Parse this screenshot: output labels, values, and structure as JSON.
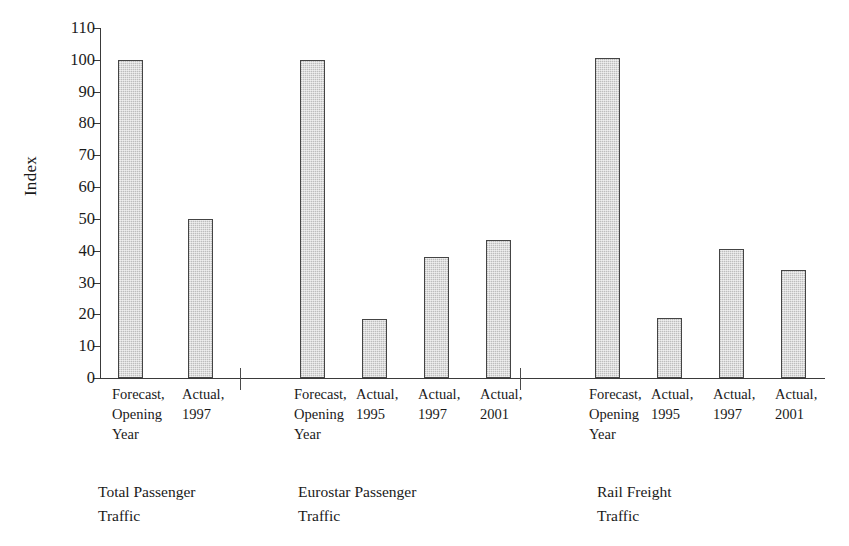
{
  "chart_data": {
    "type": "bar",
    "title": "",
    "xlabel": "",
    "ylabel": "Index",
    "ylim": [
      0,
      110
    ],
    "ytick_step": 10,
    "yticks": [
      0,
      10,
      20,
      30,
      40,
      50,
      60,
      70,
      80,
      90,
      100,
      110
    ],
    "grid": false,
    "legend": "none",
    "bar_fill_color": "#c9c9c9",
    "bar_border_color": "#444444",
    "axis_color": "#3a3a3a",
    "background_color": "#ffffff",
    "groups": [
      {
        "caption_lines": [
          "Total Passenger",
          "Traffic"
        ],
        "categories": [
          {
            "lines": [
              "Forecast,",
              "Opening",
              "Year"
            ],
            "value": 100
          },
          {
            "lines": [
              "Actual,",
              "1997"
            ],
            "value": 50
          }
        ]
      },
      {
        "caption_lines": [
          "Eurostar Passenger",
          "Traffic"
        ],
        "categories": [
          {
            "lines": [
              "Forecast,",
              "Opening",
              "Year"
            ],
            "value": 100
          },
          {
            "lines": [
              "Actual,",
              "1995"
            ],
            "value": 18.5
          },
          {
            "lines": [
              "Actual,",
              "1997"
            ],
            "value": 38
          },
          {
            "lines": [
              "Actual,",
              "2001"
            ],
            "value": 43.5
          }
        ]
      },
      {
        "caption_lines": [
          "Rail Freight",
          "Traffic"
        ],
        "categories": [
          {
            "lines": [
              "Forecast,",
              "Opening",
              "Year"
            ],
            "value": 100.5
          },
          {
            "lines": [
              "Actual,",
              "1995"
            ],
            "value": 19
          },
          {
            "lines": [
              "Actual,",
              "1997"
            ],
            "value": 40.5
          },
          {
            "lines": [
              "Actual,",
              "2001"
            ],
            "value": 34
          }
        ]
      }
    ],
    "categories": [
      "Forecast, Opening Year",
      "Actual, 1997",
      "Forecast, Opening Year",
      "Actual, 1995",
      "Actual, 1997",
      "Actual, 2001",
      "Forecast, Opening Year",
      "Actual, 1995",
      "Actual, 1997",
      "Actual, 2001"
    ],
    "values": [
      100,
      50,
      100,
      18.5,
      38,
      43.5,
      100.5,
      19,
      40.5,
      34
    ]
  },
  "layout": {
    "bar_x": [
      18,
      88,
      200,
      262,
      324,
      386,
      495,
      557,
      619,
      681
    ],
    "separator_x": [
      140,
      420
    ],
    "catlabel_x": [
      12,
      82,
      194,
      256,
      318,
      380,
      489,
      551,
      613,
      675
    ],
    "groupcap_x": [
      98,
      298,
      597
    ],
    "groupcap_y": 480
  }
}
